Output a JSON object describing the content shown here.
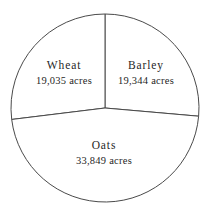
{
  "chart_data": {
    "type": "pie",
    "title": "",
    "subtitle": "",
    "xlabel": "",
    "ylabel": "",
    "legend_position": "none",
    "grid": false,
    "unit": "acres",
    "total": 72228,
    "categories": [
      "Wheat",
      "Barley",
      "Oats"
    ],
    "values": [
      19035,
      19344,
      33849
    ],
    "slices": [
      {
        "label": "Wheat",
        "value": 19035,
        "value_label": "19,035 acres",
        "percent": 26.4,
        "start_angle": 0,
        "end_angle": 95,
        "color": "#ffffff",
        "stroke": "#4a4a4a"
      },
      {
        "label": "Barley",
        "value": 19344,
        "value_label": "19,344 acres",
        "percent": 26.8,
        "start_angle": 263,
        "end_angle": 360,
        "color": "#ffffff",
        "stroke": "#4a4a4a"
      },
      {
        "label": "Oats",
        "value": 33849,
        "value_label": "33,849 acres",
        "percent": 46.9,
        "start_angle": 95,
        "end_angle": 263,
        "color": "#ffffff",
        "stroke": "#4a4a4a"
      }
    ]
  },
  "figure": {
    "background": "#ffffff",
    "line_color": "#4a4a4a",
    "text_color": "#1f1f1f",
    "center_x": 105,
    "center_y": 108,
    "radius": 94
  },
  "labels": {
    "wheat": {
      "name": "Wheat",
      "value_label": "19,035 acres",
      "x": 64,
      "y": 73
    },
    "barley": {
      "name": "Barley",
      "value_label": "19,344 acres",
      "x": 146,
      "y": 73
    },
    "oats": {
      "name": "Oats",
      "value_label": "33,849 acres",
      "x": 104,
      "y": 153
    }
  }
}
